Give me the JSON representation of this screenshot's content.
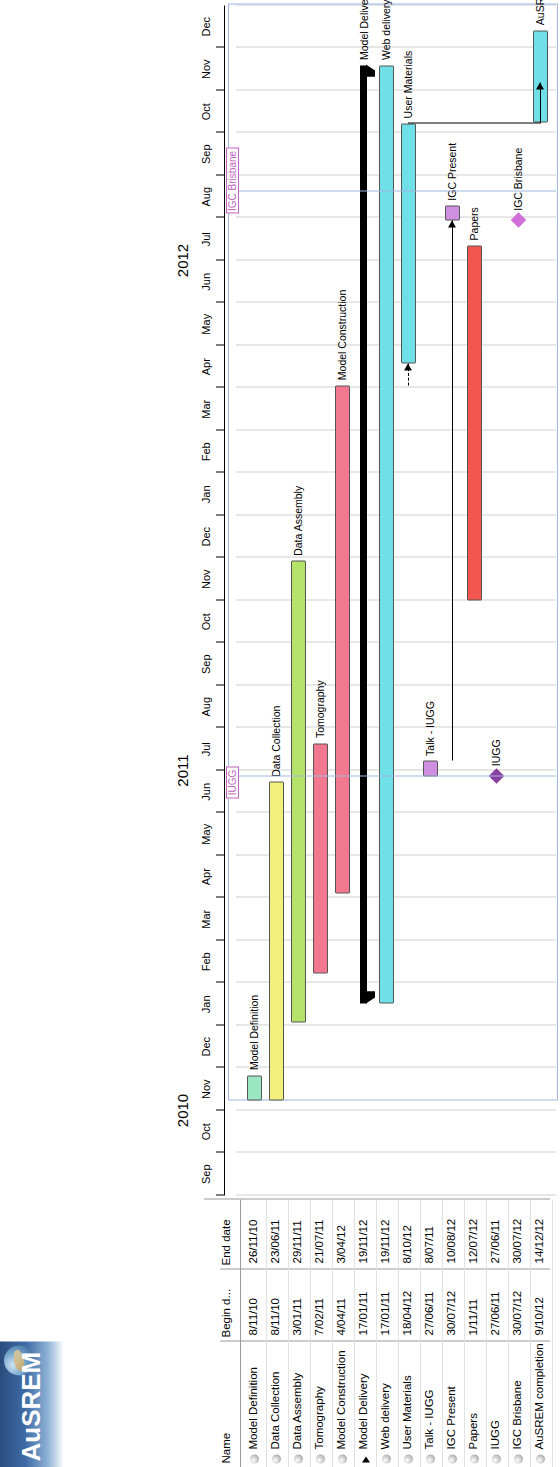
{
  "app": {
    "title": "AuSREM",
    "logo_icon": "globe-icon"
  },
  "table": {
    "headers": [
      "Name",
      "Begin d...",
      "End date"
    ],
    "rows": [
      {
        "name": "Model Definition",
        "begin": "8/11/10",
        "end": "26/11/10",
        "type": "task"
      },
      {
        "name": "Data Collection",
        "begin": "8/11/10",
        "end": "23/06/11",
        "type": "task"
      },
      {
        "name": "Data Assembly",
        "begin": "3/01/11",
        "end": "29/11/11",
        "type": "task"
      },
      {
        "name": "Tomography",
        "begin": "7/02/11",
        "end": "21/07/11",
        "type": "task"
      },
      {
        "name": "Model Construction",
        "begin": "4/04/11",
        "end": "3/04/12",
        "type": "task"
      },
      {
        "name": "Model Delivery",
        "begin": "17/01/11",
        "end": "19/11/12",
        "type": "summary"
      },
      {
        "name": "Web delivery",
        "begin": "17/01/11",
        "end": "19/11/12",
        "type": "task"
      },
      {
        "name": "User Materials",
        "begin": "18/04/12",
        "end": "8/10/12",
        "type": "task"
      },
      {
        "name": "Talk - IUGG",
        "begin": "27/06/11",
        "end": "8/07/11",
        "type": "task"
      },
      {
        "name": "IGC Present",
        "begin": "30/07/12",
        "end": "10/08/12",
        "type": "task"
      },
      {
        "name": "Papers",
        "begin": "1/11/11",
        "end": "12/07/12",
        "type": "task"
      },
      {
        "name": "IUGG",
        "begin": "27/06/11",
        "end": "27/06/11",
        "type": "milestone"
      },
      {
        "name": "IGC Brisbane",
        "begin": "30/07/12",
        "end": "30/07/12",
        "type": "milestone"
      },
      {
        "name": "AuSREM completion",
        "begin": "9/10/12",
        "end": "14/12/12",
        "type": "task"
      }
    ]
  },
  "chart_data": {
    "type": "gantt",
    "title": "AuSREM",
    "xlabel": "",
    "ylabel": "",
    "time_axis": {
      "years": [
        {
          "label": "2010",
          "start_month": "Sep 2010",
          "end_month": "Dec 2010"
        },
        {
          "label": "2011",
          "start_month": "Jan 2011",
          "end_month": "Dec 2011"
        },
        {
          "label": "2012",
          "start_month": "Jan 2012",
          "end_month": "Dec 2012"
        }
      ],
      "month_ticks": [
        "Sep",
        "Oct",
        "Nov",
        "Dec",
        "Jan",
        "Feb",
        "Mar",
        "Apr",
        "May",
        "Jun",
        "Jul",
        "Aug",
        "Sep",
        "Oct",
        "Nov",
        "Dec",
        "Jan",
        "Feb",
        "Mar",
        "Apr",
        "May",
        "Jun",
        "Jul",
        "Aug",
        "Sep",
        "Oct",
        "Nov",
        "Dec"
      ],
      "range": [
        "2010-09-01",
        "2012-12-31"
      ]
    },
    "tasks": [
      {
        "name": "Model Definition",
        "label": "Model Definition",
        "start": "2010-11-08",
        "end": "2010-11-26",
        "color": "#9ae6c0",
        "kind": "bar"
      },
      {
        "name": "Data Collection",
        "label": "Data Collection",
        "start": "2010-11-08",
        "end": "2011-06-23",
        "color": "#f2f07a",
        "kind": "bar"
      },
      {
        "name": "Data Assembly",
        "label": "Data Assembly",
        "start": "2011-01-03",
        "end": "2011-11-29",
        "color": "#b5e36a",
        "kind": "bar"
      },
      {
        "name": "Tomography",
        "label": "Tomography",
        "start": "2011-02-07",
        "end": "2011-07-21",
        "color": "#f2788f",
        "kind": "bar"
      },
      {
        "name": "Model Construction",
        "label": "Model Construction",
        "start": "2011-04-04",
        "end": "2012-04-03",
        "color": "#f2788f",
        "kind": "bar"
      },
      {
        "name": "Model Delivery",
        "label": "Model Delivery",
        "start": "2011-01-17",
        "end": "2012-11-19",
        "color": "#000000",
        "kind": "summary"
      },
      {
        "name": "Web delivery",
        "label": "Web delivery",
        "start": "2011-01-17",
        "end": "2012-11-19",
        "color": "#6fe0e8",
        "kind": "bar"
      },
      {
        "name": "User Materials",
        "label": "User Materials",
        "start": "2012-04-18",
        "end": "2012-10-08",
        "color": "#6fe0e8",
        "kind": "bar"
      },
      {
        "name": "Talk - IUGG",
        "label": "Talk - IUGG",
        "start": "2011-06-27",
        "end": "2011-07-08",
        "color": "#cf8fe0",
        "kind": "bar"
      },
      {
        "name": "IGC Present",
        "label": "IGC Present",
        "start": "2012-07-30",
        "end": "2012-08-10",
        "color": "#cf8fe0",
        "kind": "bar"
      },
      {
        "name": "Papers",
        "label": "Papers",
        "start": "2011-11-01",
        "end": "2012-07-12",
        "color": "#f2564f",
        "kind": "bar"
      },
      {
        "name": "IUGG",
        "label": "IUGG",
        "start": "2011-06-27",
        "end": "2011-06-27",
        "color": "#8a3fa0",
        "kind": "milestone"
      },
      {
        "name": "IGC Brisbane",
        "label": "IGC Brisbane",
        "start": "2012-07-30",
        "end": "2012-07-30",
        "color": "#d06fd8",
        "kind": "milestone"
      },
      {
        "name": "AuSREM completion",
        "label": "AuSREM completion",
        "start": "2012-10-09",
        "end": "2012-12-14",
        "color": "#6fe0e8",
        "kind": "bar"
      }
    ],
    "markers": [
      {
        "label": "IUGG",
        "date": "2011-06-27",
        "color": "#c060c0"
      },
      {
        "label": "IGC Brisbane",
        "date": "2012-08-20",
        "color": "#c060c0"
      }
    ],
    "legend": [],
    "grid": true
  }
}
